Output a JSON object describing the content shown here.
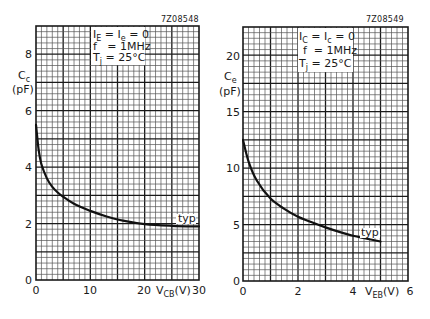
{
  "chart_data": [
    {
      "type": "line",
      "figure_code": "7Z08548",
      "title": "",
      "ylabel": "Cc",
      "yunit": "(pF)",
      "xlabel_main": "V",
      "xlabel_sub": "CB",
      "xlabel_unit": "(V)",
      "xlim": [
        0,
        30
      ],
      "ylim": [
        0,
        9
      ],
      "x_ticks": [
        "0",
        "10",
        "20",
        "30"
      ],
      "y_ticks": [
        "0",
        "2",
        "4",
        "6",
        "8"
      ],
      "conditions": [
        "I_E = I_e = 0",
        "f = 1MHz",
        "T_j = 25°C"
      ],
      "grid": true,
      "series": [
        {
          "name": "typ",
          "x": [
            0,
            0.5,
            1,
            2,
            3,
            4,
            5,
            7,
            10,
            13,
            16,
            20,
            25,
            30
          ],
          "values": [
            5.5,
            4.6,
            4.1,
            3.6,
            3.3,
            3.1,
            2.95,
            2.7,
            2.45,
            2.25,
            2.1,
            1.98,
            1.92,
            1.9
          ]
        }
      ],
      "annotations": [
        "typ"
      ]
    },
    {
      "type": "line",
      "figure_code": "7Z08549",
      "title": "",
      "ylabel": "Ce",
      "yunit": "(pF)",
      "xlabel_main": "V",
      "xlabel_sub": "EB",
      "xlabel_unit": "(V)",
      "xlim": [
        0,
        6
      ],
      "ylim": [
        0,
        22.5
      ],
      "x_ticks": [
        "0",
        "2",
        "4",
        "6"
      ],
      "y_ticks": [
        "0",
        "5",
        "10",
        "15",
        "20"
      ],
      "conditions": [
        "I_C = I_c = 0",
        "f = 1MHz",
        "T_j = 25°C"
      ],
      "grid": true,
      "series": [
        {
          "name": "typ",
          "x": [
            0,
            0.2,
            0.5,
            1,
            1.5,
            2,
            2.5,
            3,
            3.5,
            4,
            4.5,
            5
          ],
          "values": [
            12.5,
            10.6,
            8.9,
            7.3,
            6.4,
            5.7,
            5.2,
            4.75,
            4.35,
            4.0,
            3.75,
            3.5
          ]
        }
      ],
      "annotations": [
        "typ"
      ]
    }
  ],
  "charts": [
    {
      "code": "7Z08548",
      "ylabel_main": "C",
      "ylabel_sub": "c",
      "yunit": "(pF)",
      "cond1_a": "I",
      "cond1_s1": "E",
      "cond1_b": " = I",
      "cond1_s2": "e",
      "cond1_c": " = 0",
      "cond2": "f   = 1MHz",
      "cond3_a": "T",
      "cond3_s": "j",
      "cond3_b": " = 25°C",
      "x_ticks": [
        "0",
        "10",
        "20",
        "30"
      ],
      "y_ticks": [
        "0",
        "2",
        "4",
        "6",
        "8"
      ],
      "x_origin": "0",
      "xlabel_main": "V",
      "xlabel_sub": "CB",
      "xlabel_unit": "(V)",
      "x_last": "30",
      "x_mid2": "20",
      "x_mid1": "10",
      "typ": "typ"
    },
    {
      "code": "7Z08549",
      "ylabel_main": "C",
      "ylabel_sub": "e",
      "yunit": "(pF)",
      "cond1_a": "I",
      "cond1_s1": "C",
      "cond1_b": " = I",
      "cond1_s2": "c",
      "cond1_c": " = 0",
      "cond2": "f  = 1MHz",
      "cond3_a": "T",
      "cond3_s": "j",
      "cond3_b": " = 25°C",
      "x_ticks": [
        "0",
        "2",
        "4",
        "6"
      ],
      "y_ticks": [
        "0",
        "5",
        "10",
        "15",
        "20"
      ],
      "x_origin": "0",
      "xlabel_main": "V",
      "xlabel_sub": "EB",
      "xlabel_unit": "(V)",
      "x_last": "6",
      "x_mid2": "4",
      "x_mid1": "2",
      "typ": "typ"
    }
  ]
}
